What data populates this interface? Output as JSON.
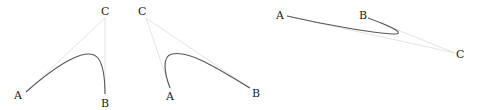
{
  "diagrams": [
    {
      "name": "bezier-1",
      "points": {
        "A": "A",
        "B": "B",
        "C": "C"
      }
    },
    {
      "name": "bezier-2",
      "points": {
        "A": "A",
        "B": "B",
        "C": "C"
      }
    },
    {
      "name": "bezier-3",
      "points": {
        "A": "A",
        "B": "B",
        "C": "C"
      }
    }
  ],
  "colors": {
    "curve": "#555555",
    "guide": "#dcdcdc",
    "label": "#1a1a1a"
  }
}
